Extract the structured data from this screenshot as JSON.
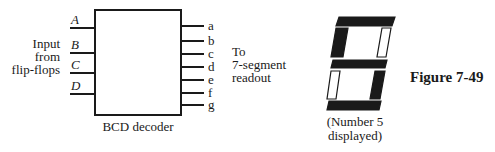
{
  "decoder": {
    "title": "BCD decoder",
    "input_caption": [
      "Input",
      "from",
      "flip-flops"
    ],
    "inputs": [
      "A",
      "B",
      "C",
      "D"
    ],
    "outputs": [
      "a",
      "b",
      "c",
      "d",
      "e",
      "f",
      "g"
    ],
    "output_caption": [
      "To",
      "7-segment",
      "readout"
    ]
  },
  "display": {
    "caption": [
      "(Number 5",
      "displayed)"
    ],
    "digit_shown": "5",
    "segments": {
      "a": "on",
      "b": "off",
      "c": "on",
      "d": "on",
      "e": "off",
      "f": "on",
      "g": "on"
    }
  },
  "figure": {
    "label": "Figure 7-49"
  },
  "colors": {
    "ink": "#1a1a1a",
    "background": "#ffffff"
  }
}
